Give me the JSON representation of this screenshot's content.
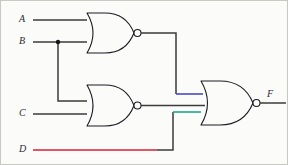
{
  "diagram": {
    "background_color": "#fbfbf9",
    "border_color": "#c9c9c4",
    "wire_color": "#3b3b3b",
    "gate_outline_color": "#1c1c24"
  },
  "inputs": [
    {
      "label": "A",
      "x": 20,
      "y": 19,
      "wire_color": "#3b3b3b"
    },
    {
      "label": "B",
      "x": 20,
      "y": 41,
      "wire_color": "#3b3b3b"
    },
    {
      "label": "C",
      "x": 20,
      "y": 113,
      "wire_color": "#3b3b3b"
    },
    {
      "label": "D",
      "x": 20,
      "y": 149,
      "wire_color": "#d81f33"
    }
  ],
  "outputs": [
    {
      "label": "F",
      "x": 265,
      "y": 94,
      "wire_color": "#3b3b3b"
    }
  ],
  "gates": [
    {
      "id": "gate-nor-1",
      "type": "NOR",
      "inputs": [
        "A",
        "B"
      ],
      "output": "N1",
      "x": 78,
      "y": 12,
      "width": 55,
      "height": 40
    },
    {
      "id": "gate-nor-2",
      "type": "NOR",
      "inputs": [
        "B",
        "C"
      ],
      "output": "N2",
      "x": 78,
      "y": 84,
      "width": 55,
      "height": 41
    },
    {
      "id": "gate-nor-3",
      "type": "NOR",
      "inputs": [
        "N1",
        "N2",
        "D"
      ],
      "output": "F",
      "x": 198,
      "y": 80,
      "width": 55,
      "height": 44
    }
  ],
  "nets": [
    {
      "id": "net-a",
      "from": "A",
      "to": "gate-nor-1",
      "color": "#3b3b3b"
    },
    {
      "id": "net-b",
      "from": "B",
      "to": "gate-nor-1",
      "color": "#3b3b3b"
    },
    {
      "id": "net-b-branch",
      "from": "B",
      "to": "gate-nor-2",
      "color": "#3b3b3b"
    },
    {
      "id": "net-c",
      "from": "C",
      "to": "gate-nor-2",
      "color": "#3b3b3b"
    },
    {
      "id": "net-d",
      "from": "D",
      "to": "gate-nor-3",
      "color": "#d81f33"
    },
    {
      "id": "net-n1",
      "from": "gate-nor-1",
      "to": "gate-nor-3",
      "color": "#4a4ac4"
    },
    {
      "id": "net-n2",
      "from": "gate-nor-2",
      "to": "gate-nor-3",
      "color": "#3b3b3b"
    },
    {
      "id": "net-f",
      "from": "gate-nor-3",
      "to": "F",
      "color": "#3b3b3b"
    }
  ],
  "highlights": [
    {
      "id": "highlight-top-input",
      "color": "#4a4ac4",
      "net": "net-n1"
    },
    {
      "id": "highlight-bottom-input",
      "color": "#20a98a",
      "net": "net-d"
    },
    {
      "id": "highlight-d-line",
      "color": "#d81f33",
      "net": "net-d"
    }
  ],
  "junctions": [
    {
      "id": "junction-b",
      "x": 57,
      "y": 41
    }
  ]
}
